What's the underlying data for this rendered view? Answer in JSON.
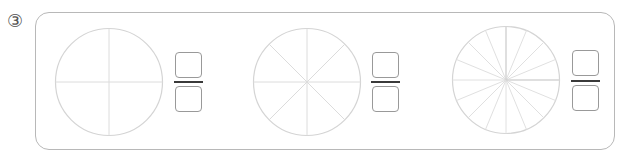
{
  "problem": {
    "number_label": "③",
    "items": [
      {
        "divisions": 4,
        "numerator": "",
        "denominator": ""
      },
      {
        "divisions": 8,
        "numerator": "",
        "denominator": ""
      },
      {
        "divisions": 16,
        "numerator": "",
        "denominator": ""
      }
    ]
  },
  "colors": {
    "frame_border": "#b8b8b8",
    "circle_stroke": "#d4d4d4",
    "fraction_bar": "#3a3a3a",
    "box_border": "#999999"
  }
}
